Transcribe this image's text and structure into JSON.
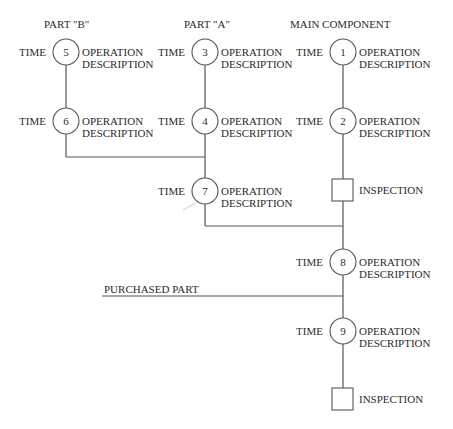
{
  "headers": {
    "part_b": "PART \"B\"",
    "part_a": "PART \"A\"",
    "main": "MAIN COMPONENT"
  },
  "operations": [
    {
      "number": "1",
      "time_label": "TIME",
      "desc_line1": "OPERATION",
      "desc_line2": "DESCRIPTION"
    },
    {
      "number": "2",
      "time_label": "TIME",
      "desc_line1": "OPERATION",
      "desc_line2": "DESCRIPTION"
    },
    {
      "number": "3",
      "time_label": "TIME",
      "desc_line1": "OPERATION",
      "desc_line2": "DESCRIPTION"
    },
    {
      "number": "4",
      "time_label": "TIME",
      "desc_line1": "OPERATION",
      "desc_line2": "DESCRIPTION"
    },
    {
      "number": "5",
      "time_label": "TIME",
      "desc_line1": "OPERATION",
      "desc_line2": "DESCRIPTION"
    },
    {
      "number": "6",
      "time_label": "TIME",
      "desc_line1": "OPERATION",
      "desc_line2": "DESCRIPTION"
    },
    {
      "number": "7",
      "time_label": "TIME",
      "desc_line1": "OPERATION",
      "desc_line2": "DESCRIPTION"
    },
    {
      "number": "8",
      "time_label": "TIME",
      "desc_line1": "OPERATION",
      "desc_line2": "DESCRIPTION"
    },
    {
      "number": "9",
      "time_label": "TIME",
      "desc_line1": "OPERATION",
      "desc_line2": "DESCRIPTION"
    }
  ],
  "inspections": [
    {
      "label": "INSPECTION"
    },
    {
      "label": "INSPECTION"
    }
  ],
  "purchased_part": "PURCHASED PART"
}
